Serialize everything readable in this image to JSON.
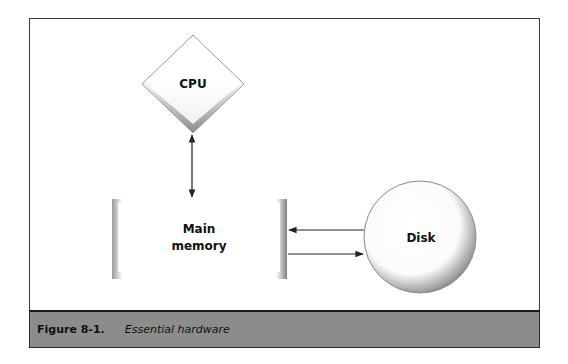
{
  "diagram": {
    "nodes": [
      {
        "id": "cpu",
        "shape": "diamond",
        "label": "CPU"
      },
      {
        "id": "main_memory",
        "shape": "rectangle",
        "label_lines": [
          "Main",
          "memory"
        ]
      },
      {
        "id": "disk",
        "shape": "circle",
        "label": "Disk"
      }
    ],
    "edges": [
      {
        "from": "cpu",
        "to": "main_memory",
        "direction": "bidirectional"
      },
      {
        "from": "disk",
        "to": "main_memory",
        "direction": "one-way"
      },
      {
        "from": "main_memory",
        "to": "disk",
        "direction": "one-way"
      }
    ]
  },
  "caption": {
    "label": "Figure 8-1.",
    "text": "Essential hardware"
  },
  "colors": {
    "frame_border": "#3a3a3a",
    "caption_bg": "#8c8c8c",
    "shape_shadow": "#8a8a8a",
    "arrow": "#222222"
  }
}
